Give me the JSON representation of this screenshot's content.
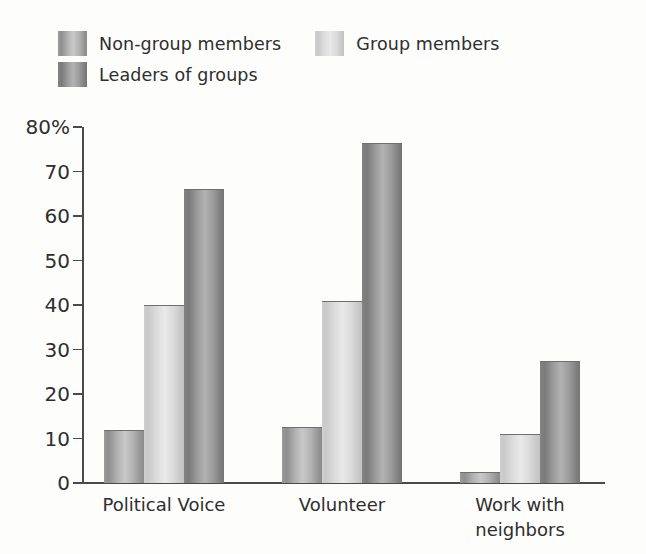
{
  "chart_data": {
    "type": "bar",
    "title": "",
    "subtitle": "",
    "xlabel": "",
    "ylabel": "",
    "ylim": [
      0,
      80
    ],
    "yticks": [
      0,
      10,
      20,
      30,
      40,
      50,
      60,
      70,
      80
    ],
    "ytick_labels": [
      "0",
      "10",
      "20",
      "30",
      "40",
      "50",
      "60",
      "70",
      "80%"
    ],
    "grid": false,
    "legend_position": "top-left",
    "categories": [
      "Political Voice",
      "Volunteer",
      "Work with neighbors"
    ],
    "category_lines": [
      [
        "Political Voice"
      ],
      [
        "Volunteer"
      ],
      [
        "Work with",
        "neighbors"
      ]
    ],
    "series": [
      {
        "name": "Non-group members",
        "color": "#a8a8a8",
        "values": [
          12,
          12.5,
          2.5
        ]
      },
      {
        "name": "Group members",
        "color": "#dcdcdc",
        "values": [
          40,
          41,
          11
        ]
      },
      {
        "name": "Leaders of groups",
        "color": "#8f8f8f",
        "values": [
          66,
          76.5,
          27.5
        ]
      }
    ]
  },
  "legend": {
    "items": [
      {
        "label": "Non-group members",
        "swatch": "#a8a8a8"
      },
      {
        "label": "Group members",
        "swatch": "#dcdcdc"
      },
      {
        "label": "Leaders of groups",
        "swatch": "#8f8f8f"
      }
    ]
  },
  "axes": {
    "y_tick_labels": [
      "80%",
      "70",
      "60",
      "50",
      "40",
      "30",
      "20",
      "10",
      "0"
    ],
    "axis_color": "#4a4a4a"
  }
}
